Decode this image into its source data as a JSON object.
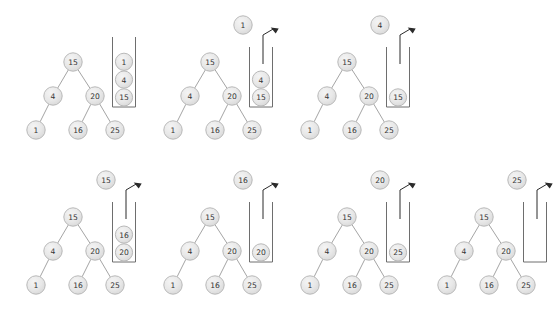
{
  "figure": {
    "background_color": "#ffffff",
    "node_fill_color": "#e6e6e6",
    "node_border_color": "#b9b9b9",
    "node_text_color": "#333333",
    "edge_color": "#9a9a9a",
    "stack_border_color": "#6e6e6e",
    "arrow_color": "#2b2b2b",
    "rows": 2,
    "panels_top_row": 3,
    "panels_bottom_row": 4
  },
  "tree": {
    "root_label": "15",
    "nodes": [
      {
        "id": "n15",
        "label": "15",
        "level": 0
      },
      {
        "id": "n4",
        "label": "4",
        "level": 1
      },
      {
        "id": "n20",
        "label": "20",
        "level": 1
      },
      {
        "id": "n1",
        "label": "1",
        "level": 2
      },
      {
        "id": "n16",
        "label": "16",
        "level": 2
      },
      {
        "id": "n25",
        "label": "25",
        "level": 2
      }
    ],
    "edges": [
      {
        "from": "n15",
        "to": "n4"
      },
      {
        "from": "n15",
        "to": "n20"
      },
      {
        "from": "n4",
        "to": "n1"
      },
      {
        "from": "n20",
        "to": "n16"
      },
      {
        "from": "n20",
        "to": "n25"
      }
    ],
    "layout": {
      "root": {
        "x": 73,
        "y": 62
      },
      "left": {
        "x": 53,
        "y": 96
      },
      "right": {
        "x": 95,
        "y": 96
      },
      "leaf_left": {
        "x": 36,
        "y": 130
      },
      "leaf_mid": {
        "x": 78,
        "y": 130
      },
      "leaf_right": {
        "x": 115,
        "y": 130
      }
    }
  },
  "panels": [
    {
      "index": 1,
      "name": "panel-1",
      "origin": {
        "x": 0,
        "y": 0
      },
      "popped_node": null,
      "stack_contents": [
        "1",
        "4",
        "15"
      ],
      "stack_top_label": "1",
      "arrow_visible": false
    },
    {
      "index": 2,
      "name": "panel-2",
      "origin": {
        "x": 137,
        "y": 0
      },
      "popped_node": "1",
      "stack_contents": [
        "4",
        "15"
      ],
      "stack_top_label": "4",
      "arrow_visible": true
    },
    {
      "index": 3,
      "name": "panel-3",
      "origin": {
        "x": 274,
        "y": 0
      },
      "popped_node": "4",
      "stack_contents": [
        "15"
      ],
      "stack_top_label": "15",
      "arrow_visible": true
    },
    {
      "index": 4,
      "name": "panel-4",
      "origin": {
        "x": 0,
        "y": 155
      },
      "popped_node": "15",
      "stack_contents": [
        "16",
        "20"
      ],
      "stack_top_label": "16",
      "arrow_visible": true
    },
    {
      "index": 5,
      "name": "panel-5",
      "origin": {
        "x": 137,
        "y": 155
      },
      "popped_node": "16",
      "stack_contents": [
        "20"
      ],
      "stack_top_label": "20",
      "arrow_visible": true
    },
    {
      "index": 6,
      "name": "panel-6",
      "origin": {
        "x": 274,
        "y": 155
      },
      "popped_node": "20",
      "stack_contents": [
        "25"
      ],
      "stack_top_label": "25",
      "arrow_visible": true
    },
    {
      "index": 7,
      "name": "panel-7",
      "origin": {
        "x": 411,
        "y": 155
      },
      "popped_node": "25",
      "stack_contents": [],
      "stack_top_label": "",
      "arrow_visible": true
    }
  ],
  "visit_order": [
    "1",
    "4",
    "15",
    "16",
    "20",
    "25"
  ]
}
